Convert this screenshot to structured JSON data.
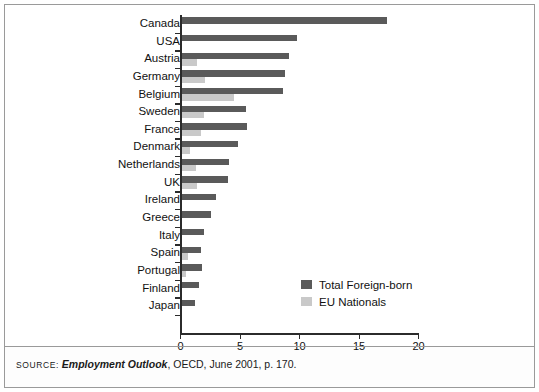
{
  "figure": {
    "source": {
      "label": "Source:",
      "title": "Employment Outlook",
      "rest": ", OECD, June 2001, p. 170."
    }
  },
  "legend": {
    "position": "inside-right",
    "items": [
      {
        "label": "Total Foreign-born",
        "color": "#5a5a5a",
        "icon": "legend-swatch-icon"
      },
      {
        "label": "EU Nationals",
        "color": "#c9c9c9",
        "icon": "legend-swatch-icon"
      }
    ]
  },
  "chart_data": {
    "type": "bar",
    "orientation": "horizontal",
    "title": "",
    "subtitle": "",
    "xlabel": "",
    "ylabel": "",
    "xlim": [
      0,
      20
    ],
    "ylim": null,
    "grid": false,
    "xticks": [
      0,
      5,
      10,
      15,
      20
    ],
    "xtick_labels": [
      "0",
      "5",
      "10",
      "15",
      "20"
    ],
    "legend_position": "inside-right",
    "categories": [
      "Canada",
      "USA",
      "Austria",
      "Germany",
      "Belgium",
      "Sweden",
      "France",
      "Denmark",
      "Netherlands",
      "UK",
      "Ireland",
      "Greece",
      "Italy",
      "Spain",
      "Portugal",
      "Finland",
      "Japan"
    ],
    "series": [
      {
        "name": "Total Foreign-born",
        "color": "#5a5a5a",
        "values": [
          17.3,
          9.7,
          9.0,
          8.7,
          8.5,
          5.4,
          5.5,
          4.7,
          4.0,
          3.9,
          2.9,
          2.5,
          1.9,
          1.6,
          1.7,
          1.5,
          1.1
        ]
      },
      {
        "name": "EU Nationals",
        "color": "#c9c9c9",
        "values": [
          0,
          0,
          1.3,
          2.0,
          4.4,
          1.9,
          1.6,
          0.7,
          1.2,
          1.3,
          0,
          0,
          0,
          0.5,
          0.4,
          0,
          0
        ]
      }
    ]
  }
}
